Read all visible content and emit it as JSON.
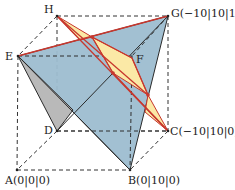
{
  "figure": {
    "type": "3d-cube-cross-section",
    "vertices": {
      "A": {
        "label": "A(0|0|0)"
      },
      "B": {
        "label": "B(0|10|0)"
      },
      "C": {
        "label": "C(−10|10|0)"
      },
      "D": {
        "label": "D"
      },
      "E": {
        "label": "E"
      },
      "F": {
        "label": "F"
      },
      "G": {
        "label": "G(−10|10|10)"
      },
      "H": {
        "label": "H"
      }
    },
    "colors": {
      "plane_blue": "#9dbdd0",
      "face_gray": "#b9b9b9",
      "triangle_yellow": "#fbe9a6",
      "line_red": "#c8372d",
      "edge_dark": "#2a2a2a",
      "dashed": "#333333"
    }
  }
}
